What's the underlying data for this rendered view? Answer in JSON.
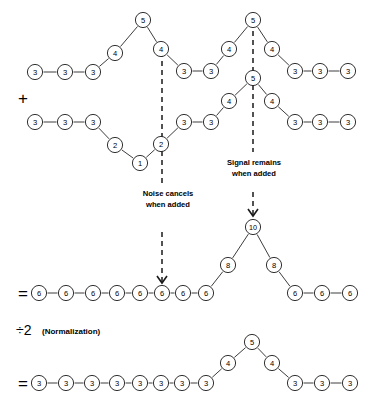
{
  "figure": {
    "title_fragment": "",
    "background": "#ffffff",
    "ink": "#1a1a1a",
    "annotations": [
      {
        "name": "noise-cancels-annotation",
        "lines": [
          "Noise cancels",
          "when added"
        ],
        "x": 168,
        "y": 196
      },
      {
        "name": "signal-remains-annotation",
        "lines": [
          "Signal remains",
          "when added"
        ],
        "x": 254,
        "y": 165
      }
    ],
    "operators": [
      {
        "name": "plus-operator",
        "symbol": "+",
        "x": 18,
        "y": 98
      },
      {
        "name": "equals-operator-sum",
        "symbol": "=",
        "x": 18,
        "y": 293
      },
      {
        "name": "equals-operator-normalized",
        "symbol": "=",
        "x": 18,
        "y": 383
      }
    ],
    "normalization": {
      "name": "normalization-label",
      "symbol": "÷2",
      "text": "(Normalization)",
      "x": 16,
      "y": 330
    },
    "rows": [
      {
        "name": "signal-row-1",
        "label": "Trace 1: signal plus noise",
        "nodes": [
          {
            "v": "3",
            "x": 35,
            "y": 72
          },
          {
            "v": "3",
            "x": 65,
            "y": 72
          },
          {
            "v": "3",
            "x": 93,
            "y": 72
          },
          {
            "v": "4",
            "x": 115,
            "y": 53
          },
          {
            "v": "5",
            "x": 143,
            "y": 20
          },
          {
            "v": "4",
            "x": 161,
            "y": 49
          },
          {
            "v": "3",
            "x": 184,
            "y": 71
          },
          {
            "v": "3",
            "x": 211,
            "y": 71
          },
          {
            "v": "4",
            "x": 229,
            "y": 49
          },
          {
            "v": "5",
            "x": 253,
            "y": 20
          },
          {
            "v": "4",
            "x": 272,
            "y": 49
          },
          {
            "v": "3",
            "x": 295,
            "y": 71
          },
          {
            "v": "3",
            "x": 320,
            "y": 71
          },
          {
            "v": "3",
            "x": 348,
            "y": 71
          }
        ],
        "links": [
          [
            0,
            1
          ],
          [
            1,
            2
          ],
          [
            2,
            3
          ],
          [
            3,
            4
          ],
          [
            4,
            5
          ],
          [
            5,
            6
          ],
          [
            6,
            7
          ],
          [
            7,
            8
          ],
          [
            8,
            9
          ],
          [
            9,
            10
          ],
          [
            10,
            11
          ],
          [
            11,
            12
          ],
          [
            12,
            13
          ]
        ]
      },
      {
        "name": "signal-row-2",
        "label": "Trace 2: signal plus inverted noise",
        "nodes": [
          {
            "v": "3",
            "x": 35,
            "y": 122
          },
          {
            "v": "3",
            "x": 65,
            "y": 122
          },
          {
            "v": "3",
            "x": 93,
            "y": 122
          },
          {
            "v": "2",
            "x": 115,
            "y": 145
          },
          {
            "v": "1",
            "x": 140,
            "y": 163
          },
          {
            "v": "2",
            "x": 161,
            "y": 144
          },
          {
            "v": "3",
            "x": 184,
            "y": 122
          },
          {
            "v": "3",
            "x": 211,
            "y": 122
          },
          {
            "v": "4",
            "x": 229,
            "y": 101
          },
          {
            "v": "5",
            "x": 253,
            "y": 78
          },
          {
            "v": "4",
            "x": 272,
            "y": 101
          },
          {
            "v": "3",
            "x": 295,
            "y": 122
          },
          {
            "v": "3",
            "x": 320,
            "y": 122
          },
          {
            "v": "3",
            "x": 348,
            "y": 122
          }
        ],
        "links": [
          [
            0,
            1
          ],
          [
            1,
            2
          ],
          [
            2,
            3
          ],
          [
            3,
            4
          ],
          [
            4,
            5
          ],
          [
            5,
            6
          ],
          [
            6,
            7
          ],
          [
            7,
            8
          ],
          [
            8,
            9
          ],
          [
            9,
            10
          ],
          [
            10,
            11
          ],
          [
            11,
            12
          ],
          [
            12,
            13
          ]
        ]
      },
      {
        "name": "sum-row",
        "label": "Sum of the two traces",
        "nodes": [
          {
            "v": "6",
            "x": 39,
            "y": 293
          },
          {
            "v": "6",
            "x": 66,
            "y": 293
          },
          {
            "v": "6",
            "x": 93,
            "y": 293
          },
          {
            "v": "6",
            "x": 117,
            "y": 293
          },
          {
            "v": "6",
            "x": 140,
            "y": 293
          },
          {
            "v": "6",
            "x": 162,
            "y": 293
          },
          {
            "v": "6",
            "x": 183,
            "y": 293
          },
          {
            "v": "6",
            "x": 206,
            "y": 293
          },
          {
            "v": "8",
            "x": 228,
            "y": 265
          },
          {
            "v": "10",
            "x": 253,
            "y": 227
          },
          {
            "v": "8",
            "x": 274,
            "y": 265
          },
          {
            "v": "6",
            "x": 295,
            "y": 293
          },
          {
            "v": "6",
            "x": 322,
            "y": 293
          },
          {
            "v": "6",
            "x": 350,
            "y": 293
          }
        ],
        "links": [
          [
            0,
            1
          ],
          [
            1,
            2
          ],
          [
            2,
            3
          ],
          [
            3,
            4
          ],
          [
            4,
            5
          ],
          [
            5,
            6
          ],
          [
            6,
            7
          ],
          [
            7,
            8
          ],
          [
            8,
            9
          ],
          [
            9,
            10
          ],
          [
            10,
            11
          ],
          [
            11,
            12
          ],
          [
            12,
            13
          ]
        ]
      },
      {
        "name": "normalized-row",
        "label": "Averaged result",
        "nodes": [
          {
            "v": "3",
            "x": 39,
            "y": 383
          },
          {
            "v": "3",
            "x": 66,
            "y": 383
          },
          {
            "v": "3",
            "x": 92,
            "y": 383
          },
          {
            "v": "3",
            "x": 117,
            "y": 383
          },
          {
            "v": "3",
            "x": 140,
            "y": 383
          },
          {
            "v": "3",
            "x": 161,
            "y": 383
          },
          {
            "v": "3",
            "x": 182,
            "y": 383
          },
          {
            "v": "3",
            "x": 206,
            "y": 383
          },
          {
            "v": "4",
            "x": 228,
            "y": 363
          },
          {
            "v": "5",
            "x": 252,
            "y": 342
          },
          {
            "v": "4",
            "x": 272,
            "y": 363
          },
          {
            "v": "3",
            "x": 295,
            "y": 383
          },
          {
            "v": "3",
            "x": 322,
            "y": 383
          },
          {
            "v": "3",
            "x": 350,
            "y": 383
          }
        ],
        "links": [
          [
            0,
            1
          ],
          [
            1,
            2
          ],
          [
            2,
            3
          ],
          [
            3,
            4
          ],
          [
            4,
            5
          ],
          [
            5,
            6
          ],
          [
            6,
            7
          ],
          [
            7,
            8
          ],
          [
            8,
            9
          ],
          [
            9,
            10
          ],
          [
            10,
            11
          ],
          [
            11,
            12
          ],
          [
            12,
            13
          ]
        ]
      }
    ],
    "arrows": [
      {
        "name": "noise-cancel-arrow",
        "x": 162,
        "y1": 52,
        "y2": 283,
        "gaps": [
          [
            184,
            232
          ]
        ]
      },
      {
        "name": "signal-remains-arrow",
        "x": 253,
        "y1": 22,
        "y2": 216,
        "gaps": [
          [
            152,
            192
          ]
        ]
      }
    ]
  }
}
